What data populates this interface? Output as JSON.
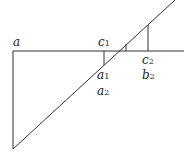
{
  "diagram": {
    "labels": {
      "a": "a",
      "c1_main": "c",
      "c1_sub": "1",
      "c2_main": "c",
      "c2_sub": "2",
      "a1_main": "a",
      "a1_sub": "1",
      "a2_main": "a",
      "a2_sub": "2",
      "b2_main": "b",
      "b2_sub": "2"
    },
    "colors": {
      "stroke": "#333333",
      "background": "#ffffff"
    }
  }
}
